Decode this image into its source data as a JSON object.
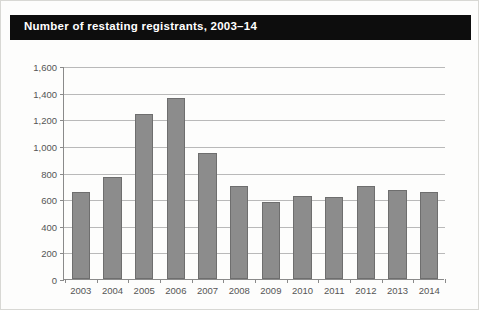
{
  "figure": {
    "title": "Number of restating registrants, 2003–14",
    "background_color": "#fdfdfc",
    "border_color": "#d8d8d4",
    "title_bar_color": "#0d0d0d",
    "title_text_color": "#ffffff"
  },
  "chart_data": {
    "type": "bar",
    "title": "Number of restating registrants, 2003–14",
    "subtitle": "",
    "xlabel": "",
    "ylabel": "",
    "categories": [
      "2003",
      "2004",
      "2005",
      "2006",
      "2007",
      "2008",
      "2009",
      "2010",
      "2011",
      "2012",
      "2013",
      "2014"
    ],
    "values": [
      650,
      770,
      1240,
      1360,
      950,
      700,
      580,
      625,
      615,
      700,
      665,
      655
    ],
    "ylim": [
      0,
      1600
    ],
    "ytick_step": 200,
    "ytick_labels": [
      "0",
      "200",
      "400",
      "600",
      "800",
      "1,000",
      "1,200",
      "1,400",
      "1,600"
    ],
    "ytick_values": [
      0,
      200,
      400,
      600,
      800,
      1000,
      1200,
      1400,
      1600
    ],
    "grid": true,
    "grid_axis": "y",
    "grid_color": "#b9b9b9",
    "legend": false,
    "legend_position": "none",
    "bar_color": "#8c8c8c",
    "bar_edge_color": "#6e6e6e",
    "axis_color": "#8a8a8a",
    "tick_label_color": "#555555",
    "annotations": []
  }
}
